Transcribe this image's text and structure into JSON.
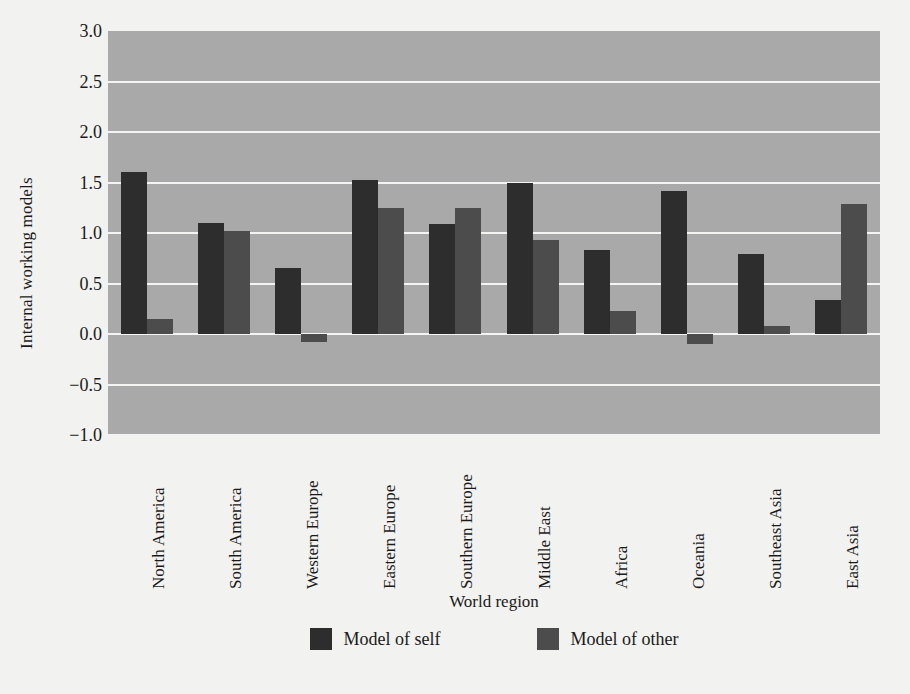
{
  "chart_data": {
    "type": "bar",
    "title": "",
    "subtitle": "",
    "xlabel": "World region",
    "ylabel": "Internal working models",
    "categories": [
      "North America",
      "South America",
      "Western Europe",
      "Eastern Europe",
      "Southern Europe",
      "Middle East",
      "Africa",
      "Oceania",
      "Southeast Asia",
      "East Asia"
    ],
    "series": [
      {
        "name": "Model of self",
        "color": "#2d2d2d",
        "values": [
          1.6,
          1.1,
          0.65,
          1.52,
          1.09,
          1.5,
          0.83,
          1.42,
          0.79,
          0.34
        ]
      },
      {
        "name": "Model of other",
        "color": "#4c4c4c",
        "values": [
          0.15,
          1.02,
          -0.08,
          1.25,
          1.25,
          0.93,
          0.23,
          -0.1,
          0.08,
          1.29
        ]
      }
    ],
    "ylim": [
      -1.0,
      3.0
    ],
    "yticks": [
      3.0,
      2.5,
      2.0,
      1.5,
      1.0,
      0.5,
      0.0,
      -0.5,
      -1.0
    ],
    "ytick_labels": [
      "3.0",
      "2.5",
      "2.0",
      "1.5",
      "1.0",
      "0.5",
      "0.0",
      "−0.5",
      "−1.0"
    ],
    "grid": true,
    "grid_color": "#f4f4f2",
    "plot_background": "#a9a9a9",
    "figure_background": "#f2f2f0",
    "legend_position": "bottom",
    "xtick_rotation": 90
  }
}
